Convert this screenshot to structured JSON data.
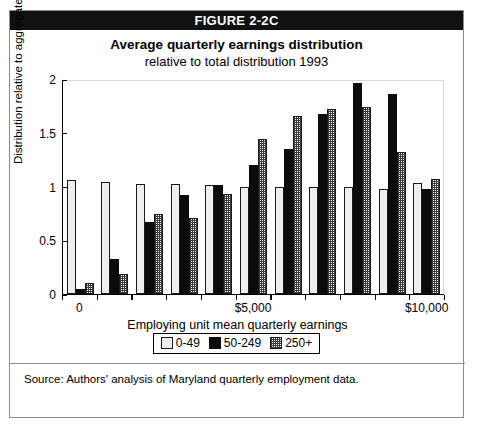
{
  "figure": {
    "banner_label": "FIGURE 2-2C",
    "title": "Average quarterly earnings distribution",
    "subtitle": "relative to total distribution 1993",
    "source": "Source: Authors' analysis of Maryland quarterly employment data."
  },
  "chart_data": {
    "type": "bar",
    "title": "Average quarterly earnings distribution",
    "subtitle": "relative to total distribution 1993",
    "xlabel": "Employing unit mean quarterly earnings",
    "ylabel": "Distribution relative to aggregate",
    "ylim": [
      0,
      2
    ],
    "yticks": [
      0,
      0.5,
      1,
      1.5,
      2
    ],
    "ytick_labels": [
      "0",
      "0.5",
      "1",
      "1.5",
      "2"
    ],
    "grid": false,
    "legend_position": "bottom",
    "x_tick_labels": [
      "0",
      "$5,000",
      "$10,000"
    ],
    "x_tick_values": [
      0,
      5000,
      10000
    ],
    "categories": [
      "0",
      "1000",
      "2000",
      "3000",
      "4000",
      "5000",
      "6000",
      "7000",
      "8000",
      "9000",
      "10000"
    ],
    "series": [
      {
        "name": "0-49",
        "values": [
          1.06,
          1.04,
          1.02,
          1.02,
          1.01,
          1.0,
          1.0,
          1.0,
          1.0,
          0.98,
          1.03
        ]
      },
      {
        "name": "50-249",
        "values": [
          0.05,
          0.33,
          0.67,
          0.92,
          1.01,
          1.2,
          1.35,
          1.67,
          1.96,
          1.86,
          0.98
        ]
      },
      {
        "name": "250+",
        "values": [
          0.1,
          0.19,
          0.74,
          0.71,
          0.93,
          1.44,
          1.66,
          1.72,
          1.74,
          1.32,
          1.07
        ]
      }
    ]
  },
  "legend": {
    "entries": [
      {
        "label": "0-49",
        "swatch": "white-square",
        "color": "#eeeeec"
      },
      {
        "label": "50-249",
        "swatch": "black-square",
        "color": "#0b0b0b"
      },
      {
        "label": "250+",
        "swatch": "hatched-square",
        "color": "#3a3a3a"
      }
    ]
  }
}
